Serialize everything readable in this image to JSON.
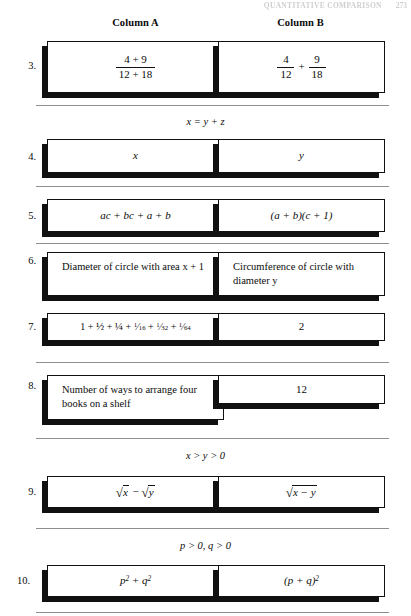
{
  "running_head": {
    "text": "QUANTITATIVE COMPARISON",
    "page_number": "273"
  },
  "headers": {
    "column_a": "Column A",
    "column_b": "Column B"
  },
  "rows": [
    {
      "number": "3.",
      "given": null,
      "column_a": {
        "type": "fraction",
        "numerator": "4 + 9",
        "denominator": "12 + 18",
        "text": "(4 + 9) / (12 + 18)"
      },
      "column_b": {
        "type": "fraction_sum",
        "first": {
          "numerator": "4",
          "denominator": "12"
        },
        "operator": "+",
        "second": {
          "numerator": "9",
          "denominator": "18"
        },
        "text": "4/12 + 9/18"
      }
    },
    {
      "number": "4.",
      "given": "x = y + z",
      "column_a": {
        "type": "variable",
        "text": "x"
      },
      "column_b": {
        "type": "variable",
        "text": "y"
      }
    },
    {
      "number": "5.",
      "given": null,
      "column_a": {
        "type": "expression",
        "text": "ac + bc + a + b"
      },
      "column_b": {
        "type": "expression",
        "text": "(a + b)(c + 1)"
      }
    },
    {
      "number": "6.",
      "given": null,
      "column_a": {
        "type": "prose",
        "text": "Diameter of circle with area x + 1"
      },
      "column_b": {
        "type": "prose",
        "text": "Circumference of circle with diameter y"
      }
    },
    {
      "number": "7.",
      "given": null,
      "column_a": {
        "type": "series",
        "text": "1 + ½ + ¼ + 1/16 + 1/32 + 1/64"
      },
      "column_b": {
        "type": "number",
        "text": "2"
      }
    },
    {
      "number": "8.",
      "given": null,
      "column_a": {
        "type": "prose",
        "text": "Number of ways to arrange four books on a shelf"
      },
      "column_b": {
        "type": "number",
        "text": "12"
      }
    },
    {
      "number": "9.",
      "given": "x > y > 0",
      "column_a": {
        "type": "radical_difference",
        "text": "√x − √y"
      },
      "column_b": {
        "type": "radical",
        "radicand": "x − y",
        "text": "√(x − y)"
      }
    },
    {
      "number": "10.",
      "given": "p > 0, q > 0",
      "column_a": {
        "type": "expression",
        "text": "p² + q²"
      },
      "column_b": {
        "type": "expression",
        "text": "(p + q)²"
      }
    }
  ]
}
